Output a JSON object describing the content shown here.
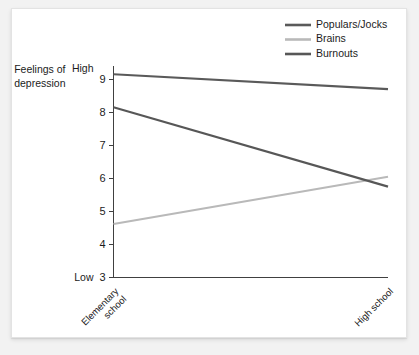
{
  "chart_data": {
    "type": "line",
    "title": "",
    "subtitle": "",
    "xlabel": "",
    "ylabel": "Feelings of depression",
    "ylabel_line1": "Feelings of",
    "ylabel_line2": "depression",
    "categories": [
      "Elementary school",
      "High school"
    ],
    "category_labels": [
      {
        "line1": "Elementary",
        "line2": "school"
      },
      {
        "line1": "High school",
        "line2": ""
      }
    ],
    "x": [
      0,
      1
    ],
    "ylim": [
      3,
      9.4
    ],
    "yticks": [
      3,
      4,
      5,
      6,
      7,
      8,
      9
    ],
    "ytick_labels": [
      "3",
      "4",
      "5",
      "6",
      "7",
      "8",
      "9"
    ],
    "y_low_label": "Low",
    "y_high_label": "High",
    "grid": false,
    "legend_position": "top-right",
    "series": [
      {
        "name": "Populars/Jocks",
        "values": [
          9.15,
          8.7
        ],
        "color": "#5a5a5a"
      },
      {
        "name": "Brains",
        "values": [
          4.62,
          6.05
        ],
        "color": "#b9b9b9"
      },
      {
        "name": "Burnouts",
        "values": [
          8.15,
          5.75
        ],
        "color": "#575757"
      }
    ]
  },
  "legend": {
    "items": [
      {
        "label": "Populars/Jocks",
        "color": "#5a5a5a"
      },
      {
        "label": "Brains",
        "color": "#b9b9b9"
      },
      {
        "label": "Burnouts",
        "color": "#575757"
      }
    ]
  },
  "colors": {
    "background": "#f2f2f2",
    "panel": "#ffffff",
    "axis": "#404040",
    "text": "#1c1c1c"
  }
}
